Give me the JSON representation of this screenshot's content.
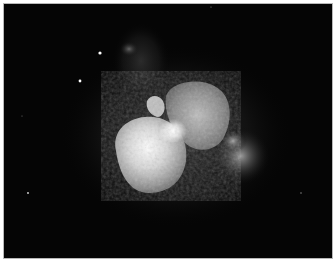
{
  "image": {
    "subject": "bipolar nebula with bright central star against dark starfield",
    "colors": {
      "background": "#050505",
      "frame_border": "#b8b8b8",
      "page": "#ffffff",
      "lobe_bright": "#f2f2f2",
      "lobe_mid": "#9a9a9a",
      "nebulosity": "#3a3a3a"
    },
    "stars": [
      {
        "x": 99,
        "y": 52,
        "r": 1.6
      },
      {
        "x": 79,
        "y": 80,
        "r": 1.4
      },
      {
        "x": 27,
        "y": 192,
        "r": 0.9
      },
      {
        "x": 300,
        "y": 192,
        "r": 0.7
      },
      {
        "x": 21,
        "y": 115,
        "r": 0.5
      },
      {
        "x": 210,
        "y": 6,
        "r": 0.6
      }
    ]
  }
}
